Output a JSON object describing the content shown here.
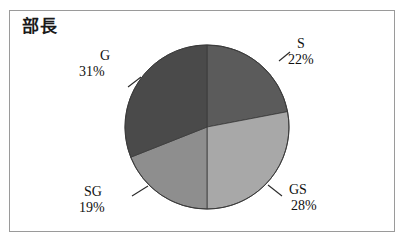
{
  "figure": {
    "title": "部長",
    "border_color": "#9a9a9a",
    "background": "#ffffff"
  },
  "chart_data": {
    "type": "pie",
    "title": "部長",
    "xlabel": "",
    "ylabel": "",
    "grid": false,
    "legend": "none",
    "labels_position": "outside-with-leader-lines",
    "start_angle_deg": 0,
    "direction": "clockwise",
    "categories": [
      "S",
      "GS",
      "SG",
      "G"
    ],
    "values": [
      22,
      28,
      19,
      31
    ],
    "value_unit": "percent",
    "slices": [
      {
        "name": "S",
        "value": 22,
        "label": "S",
        "percent_label": "22%",
        "color": "#5b5b5b",
        "start_deg": 0,
        "end_deg": 79.2
      },
      {
        "name": "GS",
        "value": 28,
        "label": "GS",
        "percent_label": "28%",
        "color": "#a8a8a8",
        "start_deg": 79.2,
        "end_deg": 180.0
      },
      {
        "name": "SG",
        "value": 19,
        "label": "SG",
        "percent_label": "19%",
        "color": "#8e8e8e",
        "start_deg": 180.0,
        "end_deg": 248.4
      },
      {
        "name": "G",
        "value": 31,
        "label": "G",
        "percent_label": "31%",
        "color": "#4a4a4a",
        "start_deg": 248.4,
        "end_deg": 360.0
      }
    ],
    "geometry": {
      "center_x": 207,
      "center_y": 127,
      "radius": 82,
      "outline_color": "#3a3a3a"
    }
  },
  "labels": {
    "s": {
      "name": "S",
      "pct": "22%"
    },
    "gs": {
      "name": "GS",
      "pct": "28%"
    },
    "sg": {
      "name": "SG",
      "pct": "19%"
    },
    "g": {
      "name": "G",
      "pct": "31%"
    }
  }
}
